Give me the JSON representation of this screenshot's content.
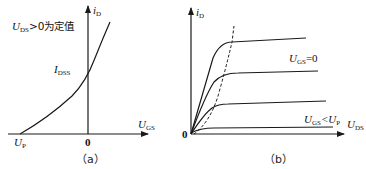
{
  "panel_a": {
    "caption": "（a）",
    "y_axis_label": "i",
    "y_axis_sub": "D",
    "x_axis_label": "U",
    "x_axis_sub": "GS",
    "origin_label": "0",
    "condition_label_main": "U",
    "condition_label_sub": "DS",
    "condition_label_rest": ">0为定值",
    "idss_label": "I",
    "idss_sub": "DSS",
    "up_label": "U",
    "up_sub": "P"
  },
  "panel_b": {
    "caption": "（b）",
    "y_axis_label": "i",
    "y_axis_sub": "D",
    "x_axis_label": "U",
    "x_axis_sub": "DS",
    "origin_label": "0",
    "curve_label_top": "U",
    "curve_label_top_sub": "GS",
    "curve_label_top_rest": "=0",
    "curve_label_bottom": "U",
    "curve_label_bottom_sub": "GS",
    "curve_label_bottom_mid": "<U",
    "curve_label_bottom_sub2": "P"
  },
  "colors": {
    "line": "#1a1a1a",
    "background": "#ffffff"
  }
}
